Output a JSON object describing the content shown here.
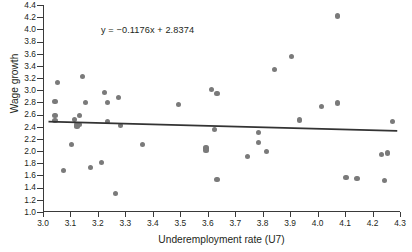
{
  "chart_data": {
    "type": "scatter",
    "title": "",
    "xlabel": "Underemployment rate (U7)",
    "ylabel": "Wage growth",
    "xlim": [
      3.0,
      4.3
    ],
    "ylim": [
      1.0,
      4.4
    ],
    "xtick_step": 0.1,
    "ytick_step": 0.2,
    "xticks": [
      "3.0",
      "3.1",
      "3.2",
      "3.3",
      "3.4",
      "3.5",
      "3.6",
      "3.7",
      "3.8",
      "3.9",
      "4.0",
      "4.1",
      "4.2",
      "4.3"
    ],
    "yticks": [
      "1.0",
      "1.2",
      "1.4",
      "1.6",
      "1.8",
      "2.0",
      "2.2",
      "2.4",
      "2.6",
      "2.8",
      "3.0",
      "3.2",
      "3.4",
      "3.6",
      "3.8",
      "4.0",
      "4.2",
      "4.4"
    ],
    "grid": false,
    "legend": null,
    "annotation": "y = −0.1176x + 2.8374",
    "trendline": {
      "slope": -0.1176,
      "intercept": 2.8374,
      "x_start": 3.02,
      "y_start": 2.483,
      "x_end": 4.29,
      "y_end": 2.333,
      "color": "#333333"
    },
    "marker_color": "#7a7a7a",
    "points": [
      [
        3.04,
        2.81
      ],
      [
        3.04,
        2.58
      ],
      [
        3.04,
        2.5
      ],
      [
        3.05,
        3.13
      ],
      [
        3.07,
        1.68
      ],
      [
        3.1,
        2.11
      ],
      [
        3.11,
        2.52
      ],
      [
        3.12,
        2.4
      ],
      [
        3.12,
        2.43
      ],
      [
        3.13,
        2.59
      ],
      [
        3.13,
        2.44
      ],
      [
        3.14,
        3.22
      ],
      [
        3.15,
        2.8
      ],
      [
        3.17,
        1.73
      ],
      [
        3.21,
        1.81
      ],
      [
        3.22,
        2.96
      ],
      [
        3.23,
        2.8
      ],
      [
        3.23,
        2.48
      ],
      [
        3.26,
        1.3
      ],
      [
        3.27,
        2.88
      ],
      [
        3.28,
        2.42
      ],
      [
        3.36,
        2.11
      ],
      [
        3.49,
        2.76
      ],
      [
        3.59,
        2.05
      ],
      [
        3.59,
        2.01
      ],
      [
        3.61,
        3.01
      ],
      [
        3.62,
        2.35
      ],
      [
        3.63,
        2.94
      ],
      [
        3.63,
        1.54
      ],
      [
        3.74,
        1.91
      ],
      [
        3.78,
        2.3
      ],
      [
        3.78,
        2.14
      ],
      [
        3.81,
        1.99
      ],
      [
        3.84,
        3.34
      ],
      [
        3.9,
        3.55
      ],
      [
        3.93,
        2.51
      ],
      [
        4.01,
        2.73
      ],
      [
        4.07,
        2.79
      ],
      [
        4.07,
        4.22
      ],
      [
        4.1,
        1.57
      ],
      [
        4.14,
        1.55
      ],
      [
        4.23,
        1.95
      ],
      [
        4.24,
        1.52
      ],
      [
        4.25,
        1.97
      ],
      [
        4.27,
        2.49
      ]
    ]
  }
}
